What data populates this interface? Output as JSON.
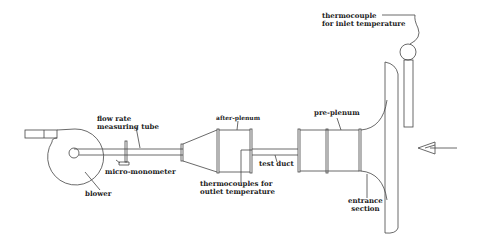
{
  "diagram": {
    "type": "experimental apparatus schematic",
    "stroke_color": "#444444",
    "components": [
      {
        "id": "blower",
        "label": "blower"
      },
      {
        "id": "flow-tube",
        "label": "flow rate measuring tube"
      },
      {
        "id": "micro-monometer",
        "label": "micro-monometer"
      },
      {
        "id": "after-plenum",
        "label": "after-plenum"
      },
      {
        "id": "outlet-thermocouples",
        "label": "thermocouples for outlet temperature"
      },
      {
        "id": "test-duct",
        "label": "test duct"
      },
      {
        "id": "pre-plenum",
        "label": "pre-plenum"
      },
      {
        "id": "entrance-section",
        "label": "entrance section"
      },
      {
        "id": "inlet-thermocouple",
        "label": "thermocouple for inlet temperature"
      }
    ],
    "flow_direction": "right-to-left",
    "labels": {
      "flow_tube_l1": "flow rate",
      "flow_tube_l2": "measuring tube",
      "micro_monometer": "micro-monometer",
      "blower": "blower",
      "after_plenum": "after-plenum",
      "thermo_outlet_l1": "thermocouples for",
      "thermo_outlet_l2": "outlet temperature",
      "test_duct": "test duct",
      "pre_plenum": "pre-plenum",
      "entrance_l1": "entrance",
      "entrance_l2": "section",
      "thermo_inlet_l1": "thermocouple",
      "thermo_inlet_l2": "for inlet temperature"
    }
  }
}
